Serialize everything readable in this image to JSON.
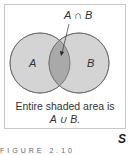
{
  "diagram": {
    "type": "venn",
    "sets": [
      {
        "name": "A",
        "label": "A"
      },
      {
        "name": "B",
        "label": "B"
      }
    ],
    "intersection_label": "A ∩ B",
    "caption_line1": "Entire shaded area is",
    "caption_line2": "A ∪ B.",
    "colors": {
      "circle_fill": "#d4d4d4",
      "intersection_fill": "#a9a9a9",
      "stroke": "#6a6a6a",
      "frame": "#c8c8c8"
    }
  },
  "marker": "S",
  "figure_label": "FIGURE 2.10"
}
